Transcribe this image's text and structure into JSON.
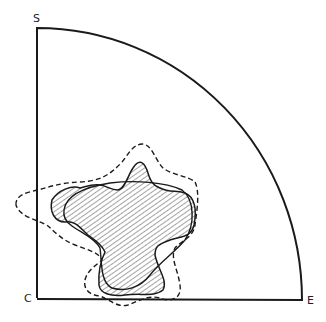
{
  "diagram": {
    "labels": {
      "top": "S",
      "corner": "C",
      "right": "E"
    },
    "shapes": [
      {
        "name": "quadrant-outline",
        "style": "solid"
      },
      {
        "name": "irregular-region",
        "style": "solid-hatched"
      },
      {
        "name": "oval-region",
        "style": "solid"
      },
      {
        "name": "outer-region",
        "style": "dashed"
      }
    ],
    "colors": {
      "stroke": "#1a1a1a",
      "background": "#ffffff"
    }
  }
}
